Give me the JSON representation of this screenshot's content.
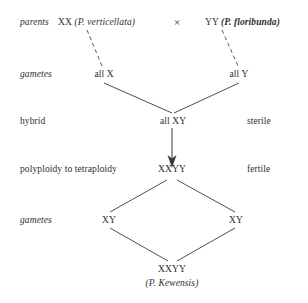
{
  "diagram": {
    "line_color": "#3a3a3a",
    "text_color": "#2e2e2e",
    "background": "#ffffff",
    "stages": [
      {
        "id": "parents",
        "label": "parents",
        "style": "italic"
      },
      {
        "id": "gametes_1",
        "label": "gametes",
        "style": "italic"
      },
      {
        "id": "hybrid",
        "label": "hybrid",
        "style": "roman"
      },
      {
        "id": "polyploidy",
        "label": "polyploidy to tetraploidy",
        "style": "roman"
      },
      {
        "id": "gametes_2",
        "label": "gametes",
        "style": "italic"
      }
    ],
    "parents": {
      "left": {
        "genotype": "XX",
        "species": "(P. verticellata)",
        "species_name": "P. verticellata",
        "emphasis": "italic"
      },
      "cross_symbol": "×",
      "right": {
        "genotype": "YY",
        "species": "(P. floribunda)",
        "species_name": "P. floribunda",
        "emphasis": "bold-italic"
      }
    },
    "gametes_first": {
      "left": "all X",
      "right": "all Y"
    },
    "hybrid": {
      "genotype": "all XY",
      "fertility": "sterile"
    },
    "tetraploid": {
      "genotype": "XXYY",
      "fertility": "fertile"
    },
    "gametes_second": {
      "left": "XY",
      "right": "XY"
    },
    "offspring": {
      "genotype": "XXYY",
      "species": "(P. Kewensis)",
      "species_name": "P. Kewensis",
      "emphasis": "italic"
    }
  }
}
